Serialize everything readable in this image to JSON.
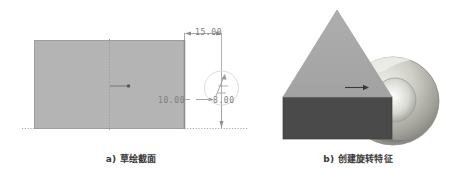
{
  "figure": {
    "background_color": "#ffffff",
    "panels": [
      {
        "id": "sketch",
        "caption": "a) 草绘截面",
        "geometry": {
          "section_fill_color": "#b4b4b4",
          "section_outline_color": "#9a9a9a",
          "centerline_color": "#a0a0a0",
          "dimension_color": "#7d7d7d"
        },
        "dimensions": [
          {
            "name": "width",
            "value": "15.00",
            "orientation": "horizontal"
          },
          {
            "name": "height",
            "value": "10.00",
            "orientation": "vertical"
          },
          {
            "name": "offset",
            "value": "8.00",
            "orientation": "horizontal"
          }
        ]
      },
      {
        "id": "model",
        "caption": "b) 创建旋转特征",
        "geometry": {
          "triangle_face_color": "#a8a8a8",
          "base_block_color": "#4a4a4a",
          "torus_highlight_color": "#e8e8e4",
          "torus_midtone_color": "#b9b9b2",
          "torus_shadow_color": "#6f6f6a",
          "arrow_color": "#3a3a3a"
        }
      }
    ]
  }
}
